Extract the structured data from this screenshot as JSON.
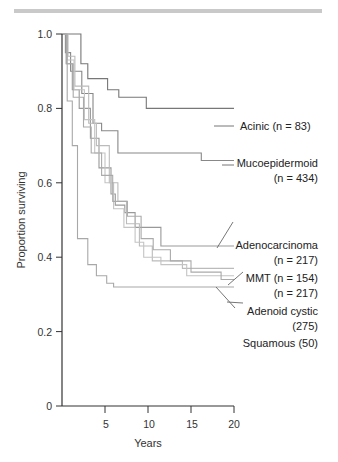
{
  "chart_data": {
    "type": "line",
    "subtype": "kaplan-meier-step",
    "title": "",
    "xlabel": "Years",
    "ylabel": "Proportion surviving",
    "xlim": [
      0,
      20
    ],
    "ylim": [
      0,
      1.0
    ],
    "xticks": [
      5,
      10,
      15,
      20
    ],
    "yticks": [
      0,
      0.2,
      0.4,
      0.6,
      0.8,
      1.0
    ],
    "ytick_labels": [
      "0",
      "0.2",
      "0.4",
      "0.6",
      "0.8",
      "1.0"
    ],
    "grid": false,
    "legend_position": "right (direct labels)",
    "series": [
      {
        "name": "Acinic (n = 83)",
        "color": "#777777",
        "x": [
          0,
          1.2,
          2.2,
          3.0,
          5.3,
          6.6,
          9.8,
          13,
          20
        ],
        "y": [
          1.0,
          1.0,
          0.92,
          0.88,
          0.85,
          0.83,
          0.8,
          0.8,
          0.8
        ]
      },
      {
        "name": "Mucoepidermoid (n = 434)",
        "color": "#888888",
        "x": [
          0,
          0.4,
          1.0,
          2.3,
          3.6,
          4.6,
          6.5,
          16.2,
          20
        ],
        "y": [
          1.0,
          0.95,
          0.9,
          0.84,
          0.76,
          0.74,
          0.68,
          0.66,
          0.66
        ]
      },
      {
        "name": "Adenocarcinoma (n = 217)",
        "color": "#999999",
        "x": [
          0,
          0.5,
          1.2,
          2.0,
          3.3,
          4.3,
          5.7,
          6.2,
          7.3,
          8.5,
          11.5,
          14.3,
          20
        ],
        "y": [
          1.0,
          0.92,
          0.85,
          0.8,
          0.72,
          0.64,
          0.57,
          0.54,
          0.52,
          0.48,
          0.43,
          0.43,
          0.43
        ]
      },
      {
        "name": "MMT (n = 154)",
        "color": "#bbbbbb",
        "x": [
          0,
          0.7,
          1.5,
          3.1,
          4.0,
          5.5,
          6.5,
          7.5,
          9.0,
          10.5,
          14.0,
          16.5,
          20
        ],
        "y": [
          1.0,
          0.94,
          0.86,
          0.76,
          0.7,
          0.6,
          0.55,
          0.49,
          0.43,
          0.39,
          0.37,
          0.37,
          0.37
        ]
      },
      {
        "name": "(n = 217)",
        "color": "#c4c4c4",
        "x": [
          0,
          0.6,
          1.4,
          2.6,
          3.8,
          5.0,
          6.0,
          7.2,
          8.5,
          9.5,
          11.5,
          14.5,
          20
        ],
        "y": [
          1.0,
          0.93,
          0.85,
          0.77,
          0.68,
          0.6,
          0.53,
          0.48,
          0.44,
          0.4,
          0.38,
          0.35,
          0.35
        ]
      },
      {
        "name": "Adenoid cystic (275)",
        "color": "#aaaaaa",
        "x": [
          0,
          0.5,
          1.3,
          2.5,
          3.4,
          4.6,
          5.9,
          7.6,
          9.2,
          10.6,
          12.6,
          15.0,
          18.5,
          20
        ],
        "y": [
          1.0,
          0.92,
          0.83,
          0.75,
          0.68,
          0.62,
          0.55,
          0.51,
          0.45,
          0.42,
          0.39,
          0.36,
          0.34,
          0.34
        ]
      },
      {
        "name": "Squamous (50)",
        "color": "#a8a8a8",
        "x": [
          0,
          0.6,
          1.2,
          1.8,
          3.0,
          4.0,
          5.2,
          6.0,
          20
        ],
        "y": [
          1.0,
          0.82,
          0.7,
          0.45,
          0.38,
          0.35,
          0.33,
          0.32,
          0.32
        ]
      }
    ],
    "annotations": [
      {
        "text": "Acinic (n = 83)",
        "target_series": "Acinic (n = 83)"
      },
      {
        "text": "Mucoepidermoid",
        "text2": "(n = 434)",
        "target_series": "Mucoepidermoid (n = 434)"
      },
      {
        "text": "Adenocarcinoma",
        "text2": "(n = 217)",
        "target_series": "Adenocarcinoma (n = 217)"
      },
      {
        "text": "MMT (n = 154)",
        "text2": "(n = 217)",
        "target_series": "MMT (n = 154)"
      },
      {
        "text": "Adenoid cystic",
        "text2": "(275)",
        "target_series": "Adenoid cystic (275)"
      },
      {
        "text": "Squamous (50)",
        "target_series": "Squamous (50)"
      }
    ]
  },
  "labels": {
    "y_title": "Proportion surviving",
    "x_title": "Years",
    "yticks": [
      "0",
      "0.2",
      "0.4",
      "0.6",
      "0.8",
      "1.0"
    ],
    "xticks": [
      "5",
      "10",
      "15",
      "20"
    ],
    "acinic": "Acinic (n = 83)",
    "muco1": "Mucoepidermoid",
    "muco2": "(n = 434)",
    "adeno1": "Adenocarcinoma",
    "adeno2": "(n = 217)",
    "mmt1": "MMT (n = 154)",
    "mmt2": "(n = 217)",
    "adcys1": "Adenoid cystic",
    "adcys2": "(275)",
    "squam": "Squamous (50)"
  }
}
